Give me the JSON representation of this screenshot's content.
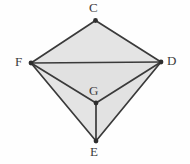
{
  "figure": {
    "background_color": "#fefefe",
    "edge_color": "#3a3a3a",
    "edge_width": 1.7,
    "face_fill": "#e4e4e4",
    "face_fill_alt": "#e0e0e0",
    "vertex_dot_color": "#2e2e2e",
    "vertex_dot_radius": 2.4,
    "label_color": "#3c3c3c",
    "vertices": [
      {
        "id": "C",
        "label": "C",
        "x": 95.5,
        "y": 20.5,
        "label_x": 89,
        "label_y": 1
      },
      {
        "id": "F",
        "label": "F",
        "x": 31.0,
        "y": 63.0,
        "label_x": 15,
        "label_y": 55
      },
      {
        "id": "D",
        "label": "D",
        "x": 161.0,
        "y": 62.0,
        "label_x": 167,
        "label_y": 54
      },
      {
        "id": "G",
        "label": "G",
        "x": 96.0,
        "y": 103.0,
        "label_x": 89,
        "label_y": 84
      },
      {
        "id": "E",
        "label": "E",
        "x": 96.0,
        "y": 141.0,
        "label_x": 90,
        "label_y": 145
      }
    ],
    "faces": [
      {
        "id": "face-CFD",
        "points": "95.5,20.5 31,63 161,62",
        "fill": "#e4e4e4"
      },
      {
        "id": "face-FGD",
        "points": "31,63 96,103 161,62",
        "fill": "#e1e1e1"
      },
      {
        "id": "face-FGE",
        "points": "31,63 96,103 96,141",
        "fill": "#e4e4e4"
      },
      {
        "id": "face-GDE",
        "points": "96,103 161,62 96,141",
        "fill": "#e2e2e2"
      }
    ],
    "edges": [
      {
        "id": "edge-CF",
        "from": "C",
        "to": "F",
        "x1": 95.5,
        "y1": 20.5,
        "x2": 31,
        "y2": 63
      },
      {
        "id": "edge-CD",
        "from": "C",
        "to": "D",
        "x1": 95.5,
        "y1": 20.5,
        "x2": 161,
        "y2": 62
      },
      {
        "id": "edge-FD",
        "from": "F",
        "to": "D",
        "x1": 31,
        "y1": 63,
        "x2": 161,
        "y2": 62
      },
      {
        "id": "edge-FG",
        "from": "F",
        "to": "G",
        "x1": 31,
        "y1": 63,
        "x2": 96,
        "y2": 103
      },
      {
        "id": "edge-GD",
        "from": "G",
        "to": "D",
        "x1": 96,
        "y1": 103,
        "x2": 161,
        "y2": 62
      },
      {
        "id": "edge-FE",
        "from": "F",
        "to": "E",
        "x1": 31,
        "y1": 63,
        "x2": 96,
        "y2": 141
      },
      {
        "id": "edge-DE",
        "from": "D",
        "to": "E",
        "x1": 161,
        "y1": 62,
        "x2": 96,
        "y2": 141
      },
      {
        "id": "edge-GE",
        "from": "G",
        "to": "E",
        "x1": 96,
        "y1": 103,
        "x2": 96,
        "y2": 141
      }
    ]
  }
}
